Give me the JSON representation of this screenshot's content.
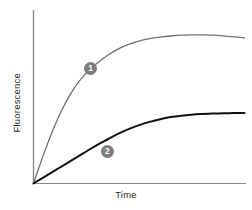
{
  "figure": {
    "background_color": "#ffffff",
    "width": 252,
    "height": 210
  },
  "axes": {
    "x_label": "Time",
    "y_label": "Fluorescence",
    "axis_color": "#8a8a8a",
    "label_color": "#2b2b2b"
  },
  "annotations": {
    "badge_1_label": "1",
    "badge_2_label": "2",
    "badge_fill_color": "#7d7d7d",
    "badge_text_color": "#ffffff"
  },
  "chart_data": {
    "type": "line",
    "title": "",
    "subtitle": "",
    "xlabel": "Time",
    "ylabel": "Fluorescence",
    "xlim": [
      0,
      100
    ],
    "ylim": [
      0,
      100
    ],
    "grid": false,
    "x_ticks": [],
    "y_ticks": [],
    "legend_position": "inline-annotation",
    "series": [
      {
        "name": "1",
        "label": "Curve 1",
        "color": "#707070",
        "line_width": 1.3,
        "annotation": "1",
        "annotation_x": 27,
        "annotation_y": 72,
        "description": "Fast saturating rise reaching a high plateau then declining slightly",
        "x": [
          0,
          5,
          10,
          15,
          20,
          25,
          30,
          35,
          40,
          45,
          50,
          55,
          60,
          65,
          70,
          75,
          80,
          85,
          90,
          95,
          100
        ],
        "y": [
          0,
          19,
          36,
          50,
          61,
          69,
          75,
          80,
          84,
          87,
          89,
          90.5,
          91.5,
          92.2,
          92.7,
          92.9,
          92.9,
          92.7,
          92.3,
          91.7,
          91.0
        ]
      },
      {
        "name": "2",
        "label": "Curve 2",
        "color": "#111111",
        "line_width": 2.0,
        "annotation": "2",
        "annotation_x": 35,
        "annotation_y": 20,
        "description": "Slow saturating rise reaching a lower plateau",
        "x": [
          0,
          5,
          10,
          15,
          20,
          25,
          30,
          35,
          40,
          45,
          50,
          55,
          60,
          65,
          70,
          75,
          80,
          85,
          90,
          95,
          100
        ],
        "y": [
          0,
          4,
          8,
          12,
          16,
          20,
          24,
          27.5,
          31,
          34,
          36.5,
          38.5,
          40.2,
          41.5,
          42.4,
          43.0,
          43.4,
          43.7,
          43.9,
          44.0,
          44.1
        ]
      }
    ]
  }
}
